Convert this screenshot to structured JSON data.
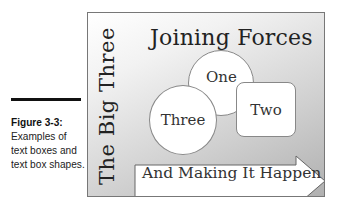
{
  "caption": {
    "figure_label": "Figure 3-3:",
    "text": "Examples of text boxes and text box shapes."
  },
  "diagram": {
    "vertical_text": "The Big Three",
    "title": "Joining Forces",
    "shapes": {
      "circle_one": "One",
      "circle_three": "Three",
      "rounded_box": "Two",
      "arrow": "And Making It Happen"
    },
    "colors": {
      "gradient_start": "#ffffff",
      "gradient_end": "#b0b0b0",
      "shape_fill": "#ffffff",
      "shape_border": "#888888",
      "text": "#222222"
    }
  }
}
